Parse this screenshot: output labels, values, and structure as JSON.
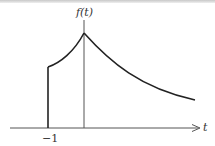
{
  "figure": {
    "y_axis_label": "f(t)",
    "x_axis_label": "t",
    "tick_label": "−1"
  },
  "colors": {
    "curve": "#222222",
    "axes": "#555555",
    "background": "#ffffff"
  }
}
